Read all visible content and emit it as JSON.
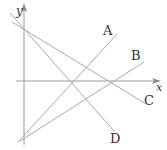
{
  "diagram": {
    "type": "coordinate-plane-lines",
    "axes": {
      "x_label": "x",
      "y_label": "y",
      "color": "#999999"
    },
    "lines": [
      {
        "label": "A",
        "x1": 18,
        "y1": 142,
        "x2": 117,
        "y2": 34,
        "label_x": 103,
        "label_y": 35
      },
      {
        "label": "B",
        "x1": 20,
        "y1": 141,
        "x2": 144,
        "y2": 62,
        "label_x": 131,
        "label_y": 60
      },
      {
        "label": "C",
        "x1": 12,
        "y1": 22,
        "x2": 146,
        "y2": 104,
        "label_x": 144,
        "label_y": 105
      },
      {
        "label": "D",
        "x1": 10,
        "y1": 13,
        "x2": 114,
        "y2": 131,
        "label_x": 110,
        "label_y": 143
      }
    ],
    "line_color": "#aaaaaa",
    "label_color": "#333333"
  }
}
